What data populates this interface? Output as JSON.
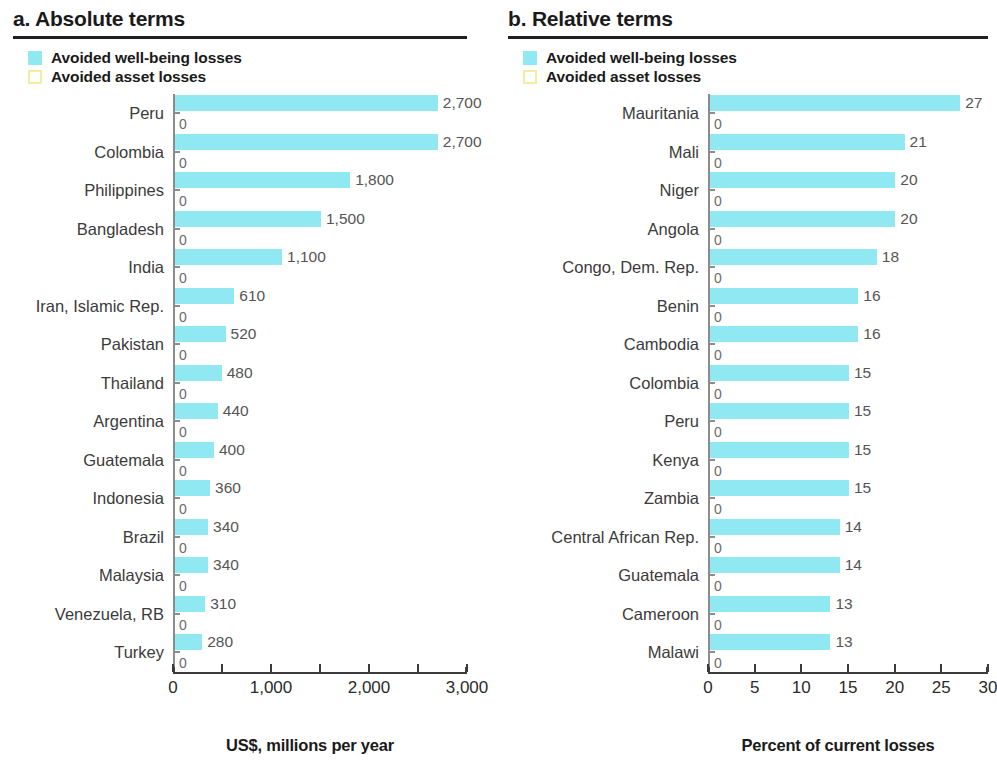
{
  "panels": [
    {
      "id": "absolute",
      "title": "a. Absolute terms",
      "legend": [
        {
          "label": "Avoided well-being losses",
          "style": "filled",
          "color": "#8fe8f2"
        },
        {
          "label": "Avoided asset losses",
          "style": "outlined",
          "color": "#f3eda0"
        }
      ],
      "axis_title": "US$, millions per year",
      "tick_labels": [
        "0",
        "1,000",
        "2,000",
        "3,000"
      ]
    },
    {
      "id": "relative",
      "title": "b. Relative terms",
      "legend": [
        {
          "label": "Avoided well-being losses",
          "style": "filled",
          "color": "#8fe8f2"
        },
        {
          "label": "Avoided asset losses",
          "style": "outlined",
          "color": "#f3eda0"
        }
      ],
      "axis_title": "Percent of current losses",
      "tick_labels": [
        "0",
        "5",
        "10",
        "15",
        "20",
        "25",
        "30"
      ]
    }
  ],
  "chart_data": [
    {
      "type": "bar",
      "orientation": "horizontal",
      "panel": "a",
      "title": "a. Absolute terms",
      "xlabel": "US$, millions per year",
      "ylabel": "",
      "xlim": [
        0,
        3000
      ],
      "xticks": [
        0,
        1000,
        2000,
        3000
      ],
      "xticklabels": [
        "0",
        "1,000",
        "2,000",
        "3,000"
      ],
      "minor_ticks": [
        500,
        1500,
        2500
      ],
      "grid": false,
      "legend_position": "top-left",
      "categories": [
        "Peru",
        "Colombia",
        "Philippines",
        "Bangladesh",
        "India",
        "Iran, Islamic Rep.",
        "Pakistan",
        "Thailand",
        "Argentina",
        "Guatemala",
        "Indonesia",
        "Brazil",
        "Malaysia",
        "Venezuela, RB",
        "Turkey"
      ],
      "series": [
        {
          "name": "Avoided well-being losses",
          "color": "#8fe8f2",
          "values": [
            2700,
            2700,
            1800,
            1500,
            1100,
            610,
            520,
            480,
            440,
            400,
            360,
            340,
            340,
            310,
            280
          ],
          "labels": [
            "2,700",
            "2,700",
            "1,800",
            "1,500",
            "1,100",
            "610",
            "520",
            "480",
            "440",
            "400",
            "360",
            "340",
            "340",
            "310",
            "280"
          ]
        },
        {
          "name": "Avoided asset losses",
          "color": "#f3eda0",
          "values": [
            0,
            0,
            0,
            0,
            0,
            0,
            0,
            0,
            0,
            0,
            0,
            0,
            0,
            0,
            0
          ],
          "labels": [
            "0",
            "0",
            "0",
            "0",
            "0",
            "0",
            "0",
            "0",
            "0",
            "0",
            "0",
            "0",
            "0",
            "0",
            "0"
          ]
        }
      ]
    },
    {
      "type": "bar",
      "orientation": "horizontal",
      "panel": "b",
      "title": "b. Relative terms",
      "xlabel": "Percent of current losses",
      "ylabel": "",
      "xlim": [
        0,
        30
      ],
      "xticks": [
        0,
        5,
        10,
        15,
        20,
        25,
        30
      ],
      "xticklabels": [
        "0",
        "5",
        "10",
        "15",
        "20",
        "25",
        "30"
      ],
      "minor_ticks": [],
      "grid": false,
      "legend_position": "top-left",
      "categories": [
        "Mauritania",
        "Mali",
        "Niger",
        "Angola",
        "Congo, Dem. Rep.",
        "Benin",
        "Cambodia",
        "Colombia",
        "Peru",
        "Kenya",
        "Zambia",
        "Central African Rep.",
        "Guatemala",
        "Cameroon",
        "Malawi"
      ],
      "series": [
        {
          "name": "Avoided well-being losses",
          "color": "#8fe8f2",
          "values": [
            27,
            21,
            20,
            20,
            18,
            16,
            16,
            15,
            15,
            15,
            15,
            14,
            14,
            13,
            13
          ],
          "labels": [
            "27",
            "21",
            "20",
            "20",
            "18",
            "16",
            "16",
            "15",
            "15",
            "15",
            "15",
            "14",
            "14",
            "13",
            "13"
          ]
        },
        {
          "name": "Avoided asset losses",
          "color": "#f3eda0",
          "values": [
            0,
            0,
            0,
            0,
            0,
            0,
            0,
            0,
            0,
            0,
            0,
            0,
            0,
            0,
            0
          ],
          "labels": [
            "0",
            "0",
            "0",
            "0",
            "0",
            "0",
            "0",
            "0",
            "0",
            "0",
            "0",
            "0",
            "0",
            "0",
            "0"
          ]
        }
      ]
    }
  ]
}
